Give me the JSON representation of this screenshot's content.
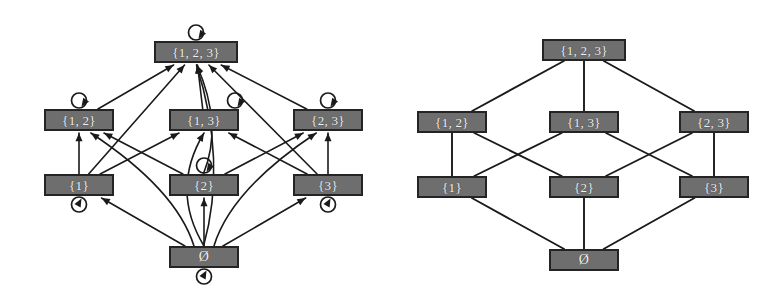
{
  "figure": {
    "background_color": "#ffffff",
    "node_fill_color": "#6e6e6e",
    "node_border_color": "#242424",
    "node_text_color": "#f2f2f2",
    "edge_color": "#1a1a1a"
  },
  "chart_data": {
    "type": "diagram",
    "title": "",
    "subtitle": "",
    "xlabel": "",
    "ylabel": "",
    "panels": [
      {
        "id": "digraph",
        "name": "subset-relation-digraph",
        "description": "Directed graph of the subset relation on the power set of {1,2,3}, including reflexive self-loops and all transitive edges",
        "directed": true,
        "has_self_loops": true,
        "nodes": [
          {
            "id": "full",
            "label": "{1, 2, 3}",
            "x": 196,
            "y": 52,
            "rank": 3,
            "self_loop": "top"
          },
          {
            "id": "s12",
            "label": "{1, 2}",
            "x": 79,
            "y": 120,
            "rank": 2,
            "self_loop": "top"
          },
          {
            "id": "s13",
            "label": "{1, 3}",
            "x": 204,
            "y": 120,
            "rank": 2,
            "self_loop": "top-right"
          },
          {
            "id": "s23",
            "label": "{2, 3}",
            "x": 328,
            "y": 120,
            "rank": 2,
            "self_loop": "top"
          },
          {
            "id": "s1",
            "label": "{1}",
            "x": 79,
            "y": 185,
            "rank": 1,
            "self_loop": "bottom"
          },
          {
            "id": "s2",
            "label": "{2}",
            "x": 204,
            "y": 185,
            "rank": 1,
            "self_loop": "top"
          },
          {
            "id": "s3",
            "label": "{3}",
            "x": 328,
            "y": 185,
            "rank": 1,
            "self_loop": "bottom"
          },
          {
            "id": "empty",
            "label": "Ø",
            "x": 204,
            "y": 257,
            "rank": 0,
            "self_loop": "bottom"
          }
        ],
        "edges": [
          {
            "from": "s12",
            "to": "full"
          },
          {
            "from": "s13",
            "to": "full"
          },
          {
            "from": "s23",
            "to": "full"
          },
          {
            "from": "s1",
            "to": "s12"
          },
          {
            "from": "s1",
            "to": "s13"
          },
          {
            "from": "s2",
            "to": "s12"
          },
          {
            "from": "s2",
            "to": "s23"
          },
          {
            "from": "s3",
            "to": "s13"
          },
          {
            "from": "s3",
            "to": "s23"
          },
          {
            "from": "s1",
            "to": "full"
          },
          {
            "from": "s2",
            "to": "full"
          },
          {
            "from": "s3",
            "to": "full"
          },
          {
            "from": "empty",
            "to": "s1"
          },
          {
            "from": "empty",
            "to": "s2"
          },
          {
            "from": "empty",
            "to": "s3"
          },
          {
            "from": "empty",
            "to": "s12"
          },
          {
            "from": "empty",
            "to": "s13"
          },
          {
            "from": "empty",
            "to": "s23"
          },
          {
            "from": "empty",
            "to": "full"
          }
        ],
        "self_loops": [
          "full",
          "s12",
          "s13",
          "s23",
          "s1",
          "s2",
          "s3",
          "empty"
        ]
      },
      {
        "id": "hasse",
        "name": "subset-relation-hasse-diagram",
        "description": "Hasse diagram (transitive reduction) of the subset relation on the power set of {1,2,3}; undirected line segments, no self-loops",
        "directed": false,
        "has_self_loops": false,
        "nodes": [
          {
            "id": "full",
            "label": "{1, 2, 3}",
            "x": 194,
            "y": 50,
            "rank": 3
          },
          {
            "id": "s12",
            "label": "{1, 2}",
            "x": 62,
            "y": 122,
            "rank": 2
          },
          {
            "id": "s13",
            "label": "{1, 3}",
            "x": 194,
            "y": 122,
            "rank": 2
          },
          {
            "id": "s23",
            "label": "{2, 3}",
            "x": 324,
            "y": 122,
            "rank": 2
          },
          {
            "id": "s1",
            "label": "{1}",
            "x": 62,
            "y": 187,
            "rank": 1
          },
          {
            "id": "s2",
            "label": "{2}",
            "x": 194,
            "y": 187,
            "rank": 1
          },
          {
            "id": "s3",
            "label": "{3}",
            "x": 324,
            "y": 187,
            "rank": 1
          },
          {
            "id": "empty",
            "label": "Ø",
            "x": 194,
            "y": 260,
            "rank": 0
          }
        ],
        "edges": [
          {
            "from": "s12",
            "to": "full"
          },
          {
            "from": "s13",
            "to": "full"
          },
          {
            "from": "s23",
            "to": "full"
          },
          {
            "from": "s1",
            "to": "s12"
          },
          {
            "from": "s1",
            "to": "s13"
          },
          {
            "from": "s2",
            "to": "s12"
          },
          {
            "from": "s2",
            "to": "s23"
          },
          {
            "from": "s3",
            "to": "s13"
          },
          {
            "from": "s3",
            "to": "s23"
          },
          {
            "from": "empty",
            "to": "s1"
          },
          {
            "from": "empty",
            "to": "s2"
          },
          {
            "from": "empty",
            "to": "s3"
          }
        ],
        "self_loops": []
      }
    ],
    "legend": [],
    "annotations": []
  }
}
